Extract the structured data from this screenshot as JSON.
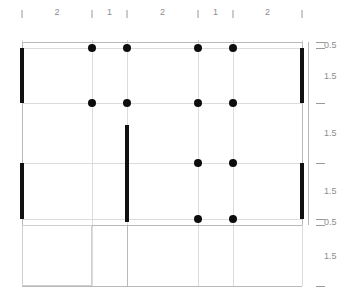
{
  "drawing": {
    "title": "Structural Framing Plan",
    "kind": "shear-wall-and-column-layout"
  },
  "colors": {
    "wall": "#111111",
    "column": "#0d0d0d",
    "gridline": "#dcdcdc",
    "dimension_text": "#8d8d8d",
    "tick": "#9a9a9a",
    "background": "#ffffff"
  },
  "top_dimension_chain": {
    "position": "top",
    "tick_positions_px": [
      22,
      92,
      127,
      198,
      233,
      302
    ],
    "segments": [
      {
        "label": "2",
        "from_px": 22,
        "to_px": 92
      },
      {
        "label": "1",
        "from_px": 92,
        "to_px": 127
      },
      {
        "label": "2",
        "from_px": 127,
        "to_px": 198
      },
      {
        "label": "1",
        "from_px": 198,
        "to_px": 233
      },
      {
        "label": "2",
        "from_px": 233,
        "to_px": 302
      }
    ],
    "labels": [
      "2",
      "1",
      "2",
      "1",
      "2"
    ]
  },
  "right_dimension_chain": {
    "position": "right",
    "tick_positions_px": [
      42,
      48,
      103,
      163,
      219,
      225,
      286
    ],
    "segments": [
      {
        "label": "0.5",
        "from_px": 42,
        "to_px": 48
      },
      {
        "label": "1.5",
        "from_px": 48,
        "to_px": 103
      },
      {
        "label": "1.5",
        "from_px": 103,
        "to_px": 163
      },
      {
        "label": "1.5",
        "from_px": 163,
        "to_px": 219
      },
      {
        "label": "0.5",
        "from_px": 219,
        "to_px": 225
      },
      {
        "label": "1.5",
        "from_px": 225,
        "to_px": 286
      }
    ],
    "labels": [
      "0.5",
      "1.5",
      "1.5",
      "1.5",
      "0.5",
      "1.5"
    ]
  },
  "grid": {
    "vertical_axes_px": [
      22,
      92,
      127,
      198,
      233,
      302
    ],
    "horizontal_axes_px": [
      42,
      48,
      103,
      163,
      219,
      225,
      286
    ]
  },
  "columns": [
    {
      "x": 92,
      "y": 48
    },
    {
      "x": 127,
      "y": 48
    },
    {
      "x": 198,
      "y": 48
    },
    {
      "x": 233,
      "y": 48
    },
    {
      "x": 92,
      "y": 103
    },
    {
      "x": 127,
      "y": 103
    },
    {
      "x": 198,
      "y": 103
    },
    {
      "x": 233,
      "y": 103
    },
    {
      "x": 198,
      "y": 163
    },
    {
      "x": 233,
      "y": 163
    },
    {
      "x": 198,
      "y": 219
    },
    {
      "x": 233,
      "y": 219
    }
  ],
  "walls": [
    {
      "orientation": "vertical",
      "x": 22,
      "y1": 48,
      "y2": 103
    },
    {
      "orientation": "vertical",
      "x": 22,
      "y1": 163,
      "y2": 219
    },
    {
      "orientation": "vertical",
      "x": 302,
      "y1": 48,
      "y2": 103
    },
    {
      "orientation": "vertical",
      "x": 302,
      "y1": 163,
      "y2": 219
    },
    {
      "orientation": "vertical",
      "x": 127,
      "y1": 125,
      "y2": 222
    }
  ]
}
